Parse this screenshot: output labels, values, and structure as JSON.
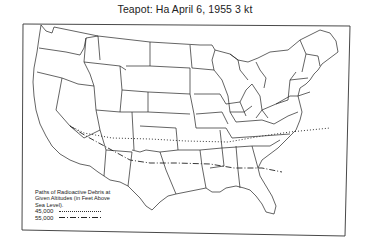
{
  "title": "Teapot: Ha  April 6, 1955  3 kt",
  "legend": {
    "heading": "Paths of Radioactive Debris at Given Altitudes (in Feet Above Sea Level).",
    "entries": [
      {
        "altitude": "45,000",
        "line_style": "dotted"
      },
      {
        "altitude": "55,000",
        "line_style": "dash-dot"
      }
    ]
  },
  "map": {
    "region": "Contiguous United States with state boundaries",
    "paths": [
      {
        "altitude": "45,000",
        "style": "dotted",
        "description": "From southern Nevada eastward across Utah/Colorado, Kansas, Missouri, Kentucky/Tennessee border, Virginia, out over the Atlantic"
      },
      {
        "altitude": "55,000",
        "style": "dash-dot",
        "description": "From southern Nevada southeastward across Arizona/New Mexico, Oklahoma/Texas, Arkansas, Mississippi, Alabama, Georgia to coast"
      }
    ]
  },
  "colors": {
    "background": "#ffffff",
    "ink": "#1a1a1a"
  }
}
